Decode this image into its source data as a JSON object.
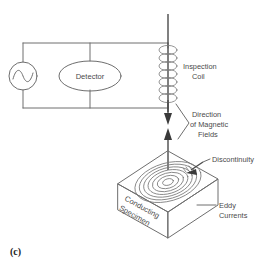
{
  "figure": {
    "caption": "(c)",
    "title_semantic": "eddy-current-inspection-diagram"
  },
  "circuit": {
    "ac_source_label": "",
    "detector_label": "Detector"
  },
  "labels": {
    "inspection_coil": [
      "Inspection",
      "Coil"
    ],
    "magnetic_fields": [
      "Direction",
      "of Magnetic",
      "Fields"
    ],
    "discontinuity": "Discontinuity",
    "eddy_currents": [
      "Eddy",
      "Currents"
    ],
    "specimen": [
      "Conducting",
      "Specimen"
    ]
  },
  "colors": {
    "line": "#6e6e6e",
    "arrow": "#3a3a3a",
    "text": "#4a4a4a",
    "caption": "#1d1d1d",
    "background": "#ffffff"
  },
  "geometry": {
    "coil_turns": 7,
    "eddy_rings": 7
  }
}
